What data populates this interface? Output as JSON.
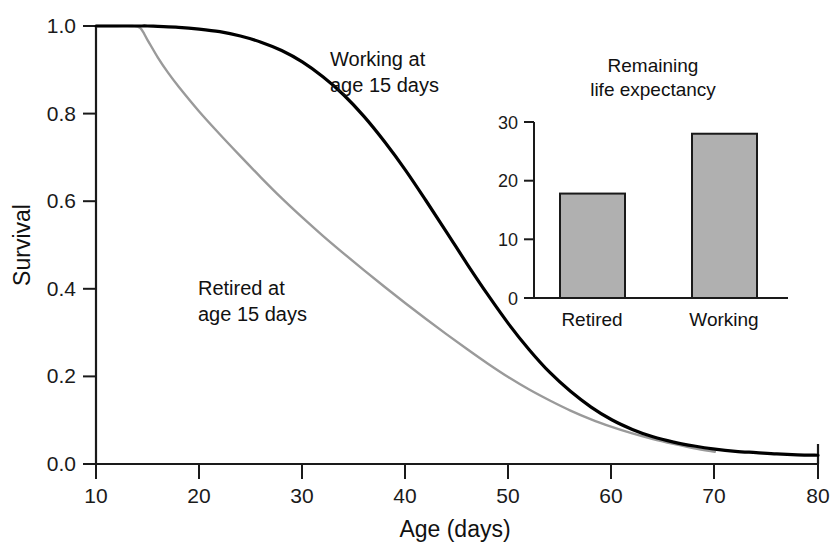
{
  "chart_data": [
    {
      "id": "main",
      "type": "line",
      "title": "",
      "xlabel": "Age (days)",
      "ylabel": "Survival",
      "xlim": [
        10,
        80
      ],
      "ylim": [
        0.0,
        1.0
      ],
      "xticks": [
        10,
        20,
        30,
        40,
        50,
        60,
        70,
        80
      ],
      "xtick_labels": [
        "10",
        "20",
        "30",
        "40",
        "50",
        "60",
        "70",
        "80"
      ],
      "yticks": [
        0.0,
        0.2,
        0.4,
        0.6,
        0.8,
        1.0
      ],
      "ytick_labels": [
        "0.0",
        "0.2",
        "0.4",
        "0.6",
        "0.8",
        "1.0"
      ],
      "grid": false,
      "legend_position": "inline-annotations",
      "series": [
        {
          "name": "Working at age 15 days",
          "color": "#000000",
          "linewidth": 3.2,
          "annotation": "Working at\nage 15 days",
          "annotation_line1": "Working at",
          "annotation_line2": "age 15 days",
          "x": [
            10,
            12,
            14,
            15,
            16,
            18,
            20,
            22,
            24,
            26,
            28,
            30,
            32,
            34,
            36,
            38,
            40,
            42,
            44,
            46,
            48,
            50,
            52,
            54,
            56,
            58,
            60,
            62,
            64,
            66,
            68,
            70,
            72,
            74,
            76,
            78,
            80
          ],
          "y": [
            1.0,
            1.0,
            1.0,
            1.0,
            0.999,
            0.997,
            0.993,
            0.987,
            0.977,
            0.963,
            0.944,
            0.918,
            0.884,
            0.843,
            0.793,
            0.735,
            0.671,
            0.601,
            0.529,
            0.456,
            0.386,
            0.32,
            0.261,
            0.209,
            0.166,
            0.13,
            0.101,
            0.079,
            0.062,
            0.05,
            0.041,
            0.034,
            0.029,
            0.026,
            0.023,
            0.021,
            0.02
          ]
        },
        {
          "name": "Retired at age 15 days",
          "color": "#9a9a9a",
          "linewidth": 2.4,
          "annotation": "Retired at\nage 15 days",
          "annotation_line1": "Retired at",
          "annotation_line2": "age 15 days",
          "x": [
            10,
            12,
            13.5,
            14.3,
            15,
            16,
            17,
            18,
            20,
            22,
            24,
            26,
            28,
            30,
            32,
            34,
            36,
            38,
            40,
            42,
            44,
            46,
            48,
            50,
            52,
            54,
            56,
            58,
            60,
            62,
            64,
            66,
            68,
            70
          ],
          "y": [
            1.0,
            1.0,
            1.0,
            0.995,
            0.968,
            0.928,
            0.893,
            0.862,
            0.805,
            0.753,
            0.703,
            0.654,
            0.607,
            0.563,
            0.521,
            0.481,
            0.442,
            0.404,
            0.367,
            0.331,
            0.296,
            0.262,
            0.229,
            0.198,
            0.17,
            0.145,
            0.122,
            0.102,
            0.085,
            0.07,
            0.057,
            0.046,
            0.036,
            0.028
          ]
        }
      ]
    },
    {
      "id": "inset",
      "type": "bar",
      "title": "Remaining life expectancy",
      "title_line1": "Remaining",
      "title_line2": "life expectancy",
      "xlabel": "",
      "ylabel": "",
      "categories": [
        "Retired",
        "Working"
      ],
      "values": [
        17.8,
        28.0
      ],
      "ylim": [
        0,
        30
      ],
      "yticks": [
        0,
        10,
        20,
        30
      ],
      "ytick_labels": [
        "0",
        "10",
        "20",
        "30"
      ],
      "grid": false,
      "bar_fill": "#b0b0b0",
      "bar_edge": "#1a1a1a"
    }
  ],
  "main": {
    "ylabel": "Survival",
    "xlabel": "Age (days)",
    "xtick_labels": [
      "10",
      "20",
      "30",
      "40",
      "50",
      "60",
      "70",
      "80"
    ],
    "ytick_labels": [
      "0.0",
      "0.2",
      "0.4",
      "0.6",
      "0.8",
      "1.0"
    ],
    "label_working_1": "Working at",
    "label_working_2": "age 15 days",
    "label_retired_1": "Retired at",
    "label_retired_2": "age 15 days"
  },
  "inset": {
    "title_1": "Remaining",
    "title_2": "life expectancy",
    "ytick_labels": [
      "0",
      "10",
      "20",
      "30"
    ],
    "cat_retired": "Retired",
    "cat_working": "Working"
  },
  "colors": {
    "working_curve": "#000000",
    "retired_curve": "#9a9a9a",
    "axis": "#1a1a1a",
    "bar_fill": "#b0b0b0",
    "bar_edge": "#1a1a1a",
    "background": "#ffffff"
  }
}
